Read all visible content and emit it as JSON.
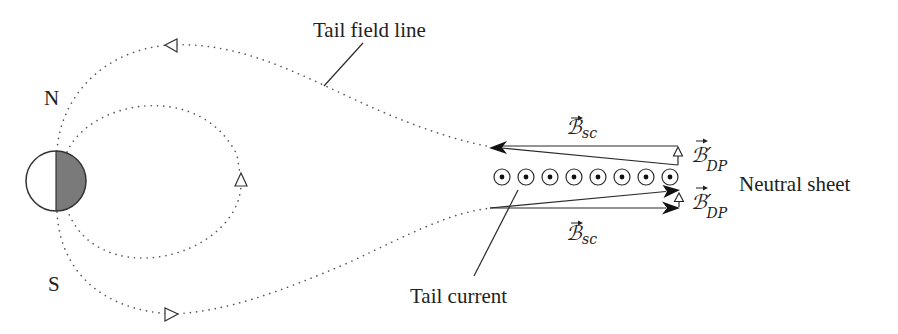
{
  "figure": {
    "labels": {
      "tail_field_line": "Tail field line",
      "north": "N",
      "south": "S",
      "neutral_sheet": "Neutral sheet",
      "tail_current": "Tail current"
    },
    "vectors": {
      "b_sc_top": {
        "symbol": "ℬ",
        "prime": "",
        "subscript": "sc"
      },
      "b_dp_top": {
        "symbol": "ℬ",
        "prime": "′",
        "subscript": "DP"
      },
      "b_dp_bottom": {
        "symbol": "ℬ",
        "prime": "′",
        "subscript": "DP"
      },
      "b_sc_bottom": {
        "symbol": "ℬ",
        "prime": "",
        "subscript": "sc"
      }
    },
    "current_markers_count": 8,
    "colors": {
      "earth_night_side": "#7a7a7a",
      "earth_day_side": "#ffffff",
      "line": "#333333",
      "text": "#222222"
    }
  }
}
